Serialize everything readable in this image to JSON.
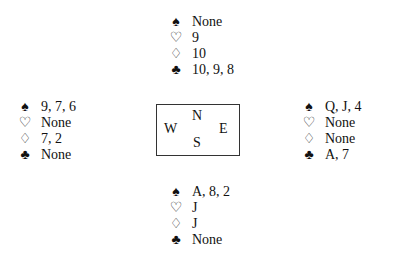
{
  "suits": {
    "spades": "♠",
    "hearts": "♡",
    "diamonds": "♢",
    "clubs": "♣"
  },
  "hands": {
    "north": {
      "spades": "None",
      "hearts": "9",
      "diamonds": "10",
      "clubs": "10, 9, 8"
    },
    "west": {
      "spades": "9, 7, 6",
      "hearts": "None",
      "diamonds": "7, 2",
      "clubs": "None"
    },
    "east": {
      "spades": "Q, J, 4",
      "hearts": "None",
      "diamonds": "None",
      "clubs": "A, 7"
    },
    "south": {
      "spades": "A, 8, 2",
      "hearts": "J",
      "diamonds": "J",
      "clubs": "None"
    }
  },
  "compass": {
    "north": "N",
    "west": "W",
    "east": "E",
    "south": "S"
  }
}
